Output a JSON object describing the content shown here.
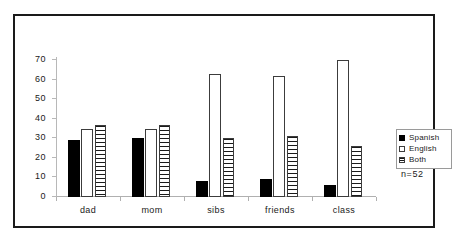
{
  "chart_data": {
    "type": "bar",
    "title": "",
    "xlabel": "",
    "ylabel": "",
    "ylim": [
      0,
      70
    ],
    "ytick_step": 10,
    "yticks": [
      0,
      10,
      20,
      30,
      40,
      50,
      60,
      70
    ],
    "grid": false,
    "legend_position": "right",
    "categories": [
      "dad",
      "mom",
      "sibs",
      "friends",
      "class"
    ],
    "series": [
      {
        "name": "Spanish",
        "swatch": "solid-black",
        "color": "#000000",
        "values": [
          29,
          30,
          8,
          9,
          6
        ]
      },
      {
        "name": "English",
        "swatch": "open-white",
        "color": "#ffffff",
        "values": [
          35,
          35,
          63,
          62,
          70
        ]
      },
      {
        "name": "Both",
        "swatch": "horizontal-hatch",
        "color": "#ffffff",
        "values": [
          37,
          37,
          30,
          31,
          26
        ]
      }
    ],
    "annotations": [
      "n=52"
    ]
  },
  "legend": {
    "items": [
      {
        "label": "Spanish"
      },
      {
        "label": "English"
      },
      {
        "label": "Both"
      }
    ]
  },
  "sample_size": "n=52"
}
